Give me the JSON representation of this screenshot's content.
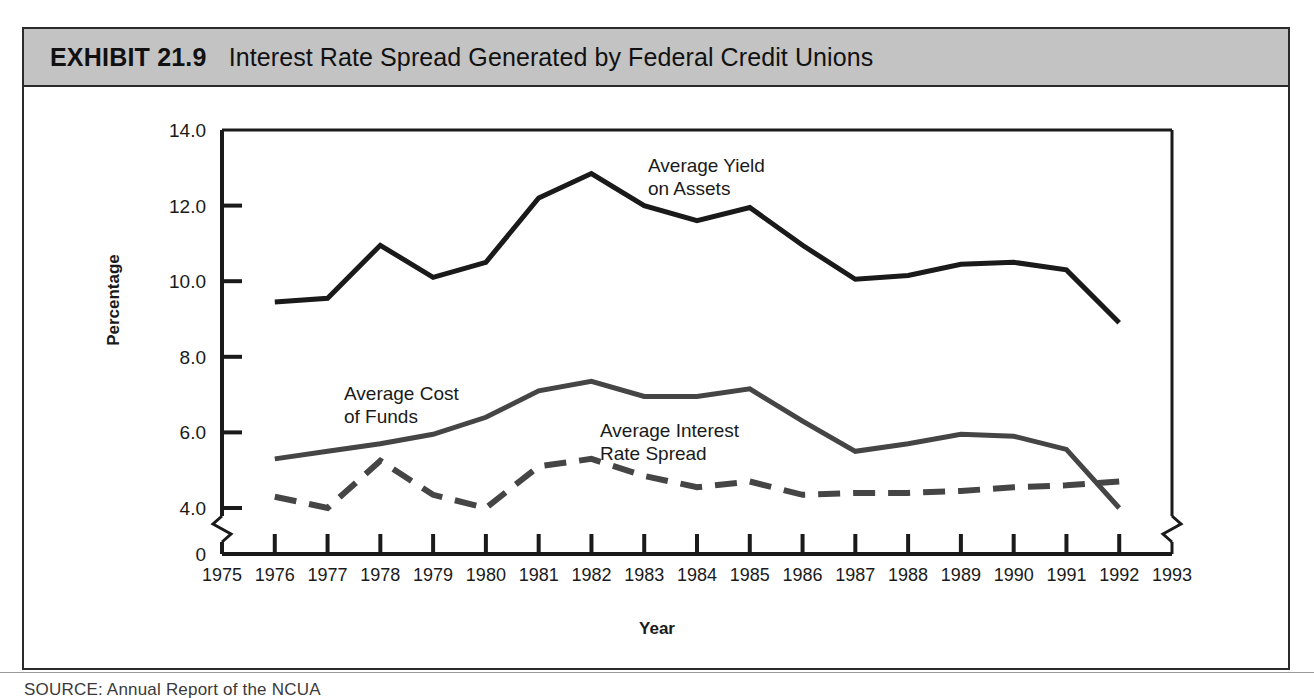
{
  "header": {
    "exhibit_number": "EXHIBIT 21.9",
    "title": "Interest Rate Spread Generated by Federal Credit Unions",
    "band_color": "#c3c3c3"
  },
  "axis": {
    "ylabel": "Percentage",
    "xlabel": "Year",
    "y_ticks": [
      "14.0",
      "12.0",
      "10.0",
      "8.0",
      "6.0",
      "4.0",
      "0"
    ],
    "x_ticks": [
      "1975",
      "1976",
      "1977",
      "1978",
      "1979",
      "1980",
      "1981",
      "1982",
      "1983",
      "1984",
      "1985",
      "1986",
      "1987",
      "1988",
      "1989",
      "1990",
      "1991",
      "1992",
      "1993"
    ],
    "y_break": true
  },
  "labels": {
    "yield_line1": "Average Yield",
    "yield_line2": "on Assets",
    "cost_line1": "Average Cost",
    "cost_line2": "of Funds",
    "spread_line1": "Average Interest",
    "spread_line2": "Rate Spread"
  },
  "source": {
    "text": "SOURCE: Annual Report of the NCUA"
  },
  "chart_data": {
    "type": "line",
    "title": "Interest Rate Spread Generated by Federal Credit Unions",
    "xlabel": "Year",
    "ylabel": "Percentage",
    "xlim": [
      1975,
      1993
    ],
    "ylim": [
      4.0,
      14.0
    ],
    "y_axis_break_below": 4.0,
    "grid": false,
    "legend": "inline-annotations",
    "x": [
      1976,
      1977,
      1978,
      1979,
      1980,
      1981,
      1982,
      1983,
      1984,
      1985,
      1986,
      1987,
      1988,
      1989,
      1990,
      1991,
      1992
    ],
    "series": [
      {
        "name": "Average Yield on Assets",
        "style": "solid",
        "color": "#1a1a1a",
        "width": 5,
        "values": [
          9.45,
          9.55,
          10.95,
          10.1,
          10.5,
          12.2,
          12.85,
          12.0,
          11.6,
          11.95,
          10.95,
          10.05,
          10.15,
          10.45,
          10.5,
          10.3,
          8.9
        ]
      },
      {
        "name": "Average Cost of Funds",
        "style": "solid",
        "color": "#454545",
        "width": 5,
        "values": [
          5.3,
          5.5,
          5.7,
          5.95,
          6.4,
          7.1,
          7.35,
          6.95,
          6.95,
          7.15,
          6.3,
          5.5,
          5.7,
          5.95,
          5.9,
          5.55,
          4.0
        ]
      },
      {
        "name": "Average Interest Rate Spread",
        "style": "dashed",
        "color": "#454545",
        "width": 6,
        "values": [
          4.3,
          4.0,
          5.25,
          4.35,
          4.0,
          5.1,
          5.3,
          4.85,
          4.55,
          4.7,
          4.35,
          4.4,
          4.4,
          4.45,
          4.55,
          4.6,
          4.7
        ]
      }
    ]
  }
}
